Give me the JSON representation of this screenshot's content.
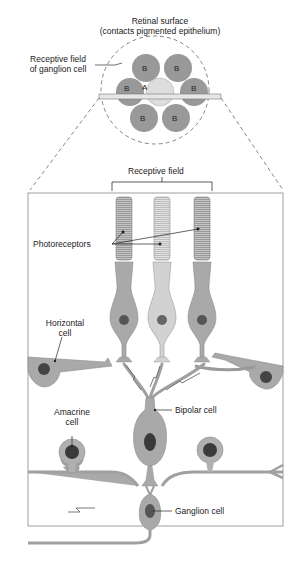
{
  "title": {
    "line1": "Retinal surface",
    "line2": "(contacts pigmented epithelium)"
  },
  "receptive_field_ganglion": {
    "line1": "Receptive field",
    "line2": "of ganglion cell"
  },
  "circles": {
    "center": "A",
    "surround": [
      "B",
      "B",
      "B",
      "B",
      "B",
      "B"
    ]
  },
  "labels": {
    "receptive_field": "Receptive field",
    "photoreceptors": "Photoreceptors",
    "horizontal_cell_1": "Horizontal",
    "horizontal_cell_2": "cell",
    "amacrine_cell_1": "Amacrine",
    "amacrine_cell_2": "cell",
    "bipolar_cell": "Bipolar cell",
    "ganglion_cell": "Ganglion cell"
  },
  "colors": {
    "cell_dark": "#8a8a8a",
    "cell_fill": "#a9a9a9",
    "cell_light": "#d8d8d8",
    "nucleus": "#3a3a3a",
    "frame": "#888888"
  }
}
